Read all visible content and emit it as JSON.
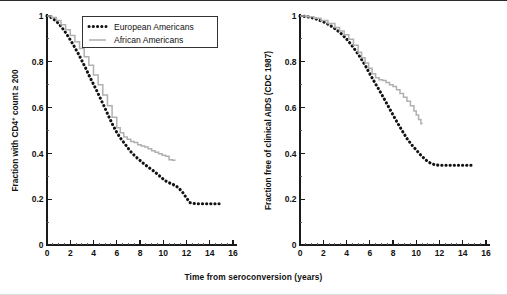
{
  "figure": {
    "shared_xlabel": "Time from seroconversion (years)",
    "legend": {
      "position": "top-center-left-panel",
      "entries": [
        {
          "label": "European Americans",
          "style": "dotted",
          "color": "#121212"
        },
        {
          "label": "African Americans",
          "style": "solid-step",
          "color": "#b0b0b0"
        }
      ]
    }
  },
  "chart_data": [
    {
      "id": "panel-cd4",
      "type": "line",
      "title": "",
      "xlabel": "Time from seroconversion (years)",
      "ylabel": "Fraction with CD4+ count ≥ 200",
      "ylabel_prefix": "Fraction with CD4",
      "ylabel_sup": "+",
      "ylabel_suffix": " count ≥ 200",
      "xlim": [
        0,
        16
      ],
      "ylim": [
        0,
        1
      ],
      "xticks": [
        0,
        2,
        4,
        6,
        8,
        10,
        12,
        14,
        16
      ],
      "xticklabels": [
        "0",
        "2",
        "4",
        "6",
        "8",
        "10",
        "12",
        "14",
        "16"
      ],
      "xminor_step": 0.5,
      "yticks": [
        0,
        0.2,
        0.4,
        0.6,
        0.8,
        1
      ],
      "yticklabels": [
        "0",
        "0.2",
        "0.4",
        "0.6",
        "0.8",
        "1"
      ],
      "yminor_step": 0.1,
      "grid": false,
      "series": [
        {
          "name": "European Americans",
          "style": "dotted",
          "color": "#121212",
          "x": [
            0.0,
            0.3,
            0.6,
            0.9,
            1.2,
            1.5,
            1.8,
            2.1,
            2.4,
            2.7,
            3.0,
            3.3,
            3.6,
            3.9,
            4.2,
            4.5,
            4.8,
            5.1,
            5.4,
            5.7,
            6.0,
            6.3,
            6.6,
            6.9,
            7.2,
            7.5,
            7.8,
            8.1,
            8.4,
            8.7,
            9.0,
            9.3,
            9.6,
            9.9,
            10.2,
            10.5,
            10.8,
            11.1,
            11.4,
            11.7,
            12.0,
            12.3,
            12.8,
            13.3,
            13.8,
            14.3,
            14.8
          ],
          "y": [
            1.0,
            0.995,
            0.985,
            0.972,
            0.955,
            0.935,
            0.912,
            0.888,
            0.862,
            0.835,
            0.805,
            0.775,
            0.742,
            0.712,
            0.682,
            0.65,
            0.618,
            0.585,
            0.552,
            0.52,
            0.492,
            0.468,
            0.448,
            0.428,
            0.408,
            0.392,
            0.378,
            0.365,
            0.352,
            0.34,
            0.33,
            0.318,
            0.305,
            0.292,
            0.28,
            0.272,
            0.265,
            0.258,
            0.245,
            0.228,
            0.205,
            0.185,
            0.18,
            0.18,
            0.18,
            0.18,
            0.18
          ]
        },
        {
          "name": "African Americans",
          "style": "solid-step",
          "color": "#b0b0b0",
          "x": [
            0.0,
            0.4,
            0.8,
            1.2,
            1.6,
            2.0,
            2.4,
            2.8,
            3.2,
            3.6,
            4.0,
            4.4,
            4.8,
            5.2,
            5.6,
            6.0,
            6.3,
            6.6,
            6.9,
            7.2,
            7.5,
            7.8,
            8.1,
            8.4,
            8.7,
            9.0,
            9.3,
            9.6,
            9.9,
            10.2,
            10.5,
            10.8,
            11.0
          ],
          "y": [
            1.0,
            0.993,
            0.98,
            0.962,
            0.94,
            0.915,
            0.888,
            0.858,
            0.822,
            0.785,
            0.742,
            0.7,
            0.655,
            0.608,
            0.558,
            0.512,
            0.49,
            0.472,
            0.462,
            0.452,
            0.448,
            0.438,
            0.432,
            0.428,
            0.42,
            0.412,
            0.405,
            0.398,
            0.392,
            0.388,
            0.372,
            0.37,
            0.368
          ]
        }
      ]
    },
    {
      "id": "panel-aids",
      "type": "line",
      "title": "",
      "xlabel": "Time from seroconversion (years)",
      "ylabel": "Fraction free of clinical AIDS (CDC 1987)",
      "xlim": [
        0,
        16
      ],
      "ylim": [
        0,
        1
      ],
      "xticks": [
        0,
        2,
        4,
        6,
        8,
        10,
        12,
        14,
        16
      ],
      "xticklabels": [
        "0",
        "2",
        "4",
        "6",
        "8",
        "10",
        "12",
        "14",
        "16"
      ],
      "xminor_step": 0.5,
      "yticks": [
        0,
        0.2,
        0.4,
        0.6,
        0.8,
        1
      ],
      "yticklabels": [
        "0",
        "0.2",
        "0.4",
        "0.6",
        "0.8",
        "1"
      ],
      "yminor_step": 0.1,
      "grid": false,
      "series": [
        {
          "name": "European Americans",
          "style": "dotted",
          "color": "#121212",
          "x": [
            0.0,
            0.5,
            1.0,
            1.5,
            2.0,
            2.5,
            3.0,
            3.5,
            4.0,
            4.4,
            4.8,
            5.2,
            5.6,
            6.0,
            6.4,
            6.8,
            7.2,
            7.6,
            8.0,
            8.4,
            8.8,
            9.2,
            9.6,
            10.0,
            10.4,
            10.8,
            11.2,
            11.6,
            12.0,
            12.5,
            13.0,
            13.5,
            14.0,
            14.5,
            15.0
          ],
          "y": [
            1.0,
            0.998,
            0.993,
            0.985,
            0.975,
            0.962,
            0.945,
            0.925,
            0.9,
            0.875,
            0.848,
            0.818,
            0.785,
            0.748,
            0.712,
            0.678,
            0.642,
            0.605,
            0.568,
            0.532,
            0.498,
            0.465,
            0.438,
            0.415,
            0.392,
            0.372,
            0.358,
            0.35,
            0.348,
            0.348,
            0.348,
            0.348,
            0.348,
            0.348,
            0.348
          ]
        },
        {
          "name": "African Americans",
          "style": "solid-step",
          "color": "#b0b0b0",
          "x": [
            0.0,
            0.6,
            1.2,
            1.8,
            2.4,
            3.0,
            3.4,
            3.8,
            4.2,
            4.6,
            5.0,
            5.3,
            5.6,
            5.9,
            6.2,
            6.5,
            6.8,
            7.1,
            7.4,
            7.7,
            8.0,
            8.3,
            8.6,
            8.9,
            9.2,
            9.5,
            9.8,
            10.0,
            10.2,
            10.4,
            10.5
          ],
          "y": [
            1.0,
            0.997,
            0.99,
            0.98,
            0.967,
            0.95,
            0.935,
            0.918,
            0.898,
            0.872,
            0.842,
            0.818,
            0.795,
            0.772,
            0.748,
            0.73,
            0.722,
            0.718,
            0.71,
            0.7,
            0.692,
            0.678,
            0.662,
            0.645,
            0.628,
            0.608,
            0.585,
            0.568,
            0.548,
            0.53,
            0.528
          ]
        }
      ]
    }
  ]
}
